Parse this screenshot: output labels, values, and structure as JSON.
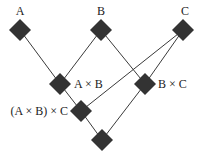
{
  "diagram": {
    "type": "lattice",
    "nodes": [
      {
        "id": "A",
        "label": "A",
        "x": 20,
        "y": 30,
        "label_x": 20,
        "label_y": 15,
        "anchor": "middle"
      },
      {
        "id": "B",
        "label": "B",
        "x": 101,
        "y": 30,
        "label_x": 101,
        "label_y": 15,
        "anchor": "middle"
      },
      {
        "id": "C",
        "label": "C",
        "x": 183,
        "y": 30,
        "label_x": 185,
        "label_y": 15,
        "anchor": "middle"
      },
      {
        "id": "AxB",
        "label": "A × B",
        "x": 60,
        "y": 84,
        "label_x": 74,
        "label_y": 88,
        "anchor": "start"
      },
      {
        "id": "BxC",
        "label": "B × C",
        "x": 145,
        "y": 84,
        "label_x": 158,
        "label_y": 88,
        "anchor": "start"
      },
      {
        "id": "AxBxC",
        "label": "(A × B) × C",
        "x": 81,
        "y": 111,
        "label_x": 68,
        "label_y": 115,
        "anchor": "end"
      },
      {
        "id": "bottom",
        "label": "",
        "x": 102,
        "y": 140
      }
    ],
    "edges": [
      {
        "from": "A",
        "to": "AxB"
      },
      {
        "from": "B",
        "to": "AxB"
      },
      {
        "from": "B",
        "to": "BxC"
      },
      {
        "from": "C",
        "to": "BxC"
      },
      {
        "from": "C",
        "to": "AxBxC"
      },
      {
        "from": "AxB",
        "to": "AxBxC"
      },
      {
        "from": "AxBxC",
        "to": "bottom"
      },
      {
        "from": "BxC",
        "to": "bottom"
      }
    ],
    "colors": {
      "node": "#333333",
      "edge": "#3a3a3a",
      "text": "#222222",
      "background": "#ffffff"
    }
  }
}
